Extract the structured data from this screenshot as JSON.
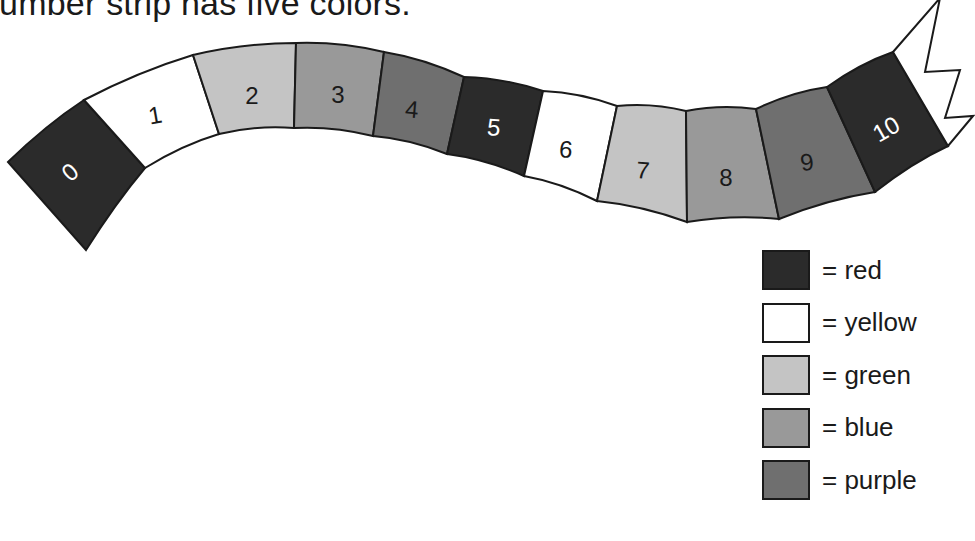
{
  "title": "number strip has five colors.",
  "palette": {
    "red": "#2b2b2b",
    "yellow": "#ffffff",
    "green": "#c4c4c4",
    "blue": "#999999",
    "purple": "#6f6f6f"
  },
  "strip": {
    "segments": [
      {
        "number": "0",
        "color": "red"
      },
      {
        "number": "1",
        "color": "yellow"
      },
      {
        "number": "2",
        "color": "green"
      },
      {
        "number": "3",
        "color": "blue"
      },
      {
        "number": "4",
        "color": "purple"
      },
      {
        "number": "5",
        "color": "red"
      },
      {
        "number": "6",
        "color": "yellow"
      },
      {
        "number": "7",
        "color": "green"
      },
      {
        "number": "8",
        "color": "blue"
      },
      {
        "number": "9",
        "color": "purple"
      },
      {
        "number": "10",
        "color": "red"
      }
    ]
  },
  "legend": {
    "items": [
      {
        "label": "= red",
        "color": "red"
      },
      {
        "label": "= yellow",
        "color": "yellow"
      },
      {
        "label": "= green",
        "color": "green"
      },
      {
        "label": "= blue",
        "color": "blue"
      },
      {
        "label": "= purple",
        "color": "purple"
      }
    ]
  }
}
